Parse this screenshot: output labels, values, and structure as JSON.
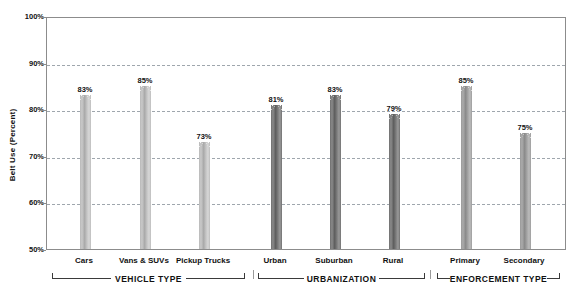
{
  "chart_data": {
    "type": "bar",
    "title": "",
    "xlabel": "",
    "ylabel": "Belt Use (Percent)",
    "ylim": [
      50,
      100
    ],
    "ytick_labels": [
      "100%",
      "90%",
      "80%",
      "70%",
      "60%",
      "50%"
    ],
    "ytick_values": [
      100,
      90,
      80,
      70,
      60,
      50
    ],
    "grid": true,
    "gridlines_at": [
      90,
      80,
      70,
      60
    ],
    "legend": "none",
    "categories": [
      "Cars",
      "Vans & SUVs",
      "Pickup Trucks",
      "Urban",
      "Suburban",
      "Rural",
      "Primary",
      "Secondary"
    ],
    "values": [
      83,
      85,
      73,
      81,
      83,
      79,
      85,
      75
    ],
    "value_labels": [
      "83%",
      "85%",
      "73%",
      "81%",
      "83%",
      "79%",
      "85%",
      "75%"
    ],
    "groups": [
      {
        "name": "VEHICLE TYPE",
        "categories": [
          "Cars",
          "Vans & SUVs",
          "Pickup Trucks"
        ],
        "values": [
          83,
          85,
          73
        ],
        "color": "#bdbdbd"
      },
      {
        "name": "URBANIZATION",
        "categories": [
          "Urban",
          "Suburban",
          "Rural"
        ],
        "values": [
          81,
          83,
          79
        ],
        "color": "#717171"
      },
      {
        "name": "ENFORCEMENT TYPE",
        "categories": [
          "Primary",
          "Secondary"
        ],
        "values": [
          85,
          75
        ],
        "color": "#9d9d9d"
      }
    ]
  },
  "axis": {
    "y_title": "Belt Use (Percent)",
    "y_ticks": [
      {
        "label": "100%",
        "value": 100
      },
      {
        "label": "90%",
        "value": 90
      },
      {
        "label": "80%",
        "value": 80
      },
      {
        "label": "70%",
        "value": 70
      },
      {
        "label": "60%",
        "value": 60
      },
      {
        "label": "50%",
        "value": 50
      }
    ]
  },
  "bars": [
    {
      "label": "Cars",
      "value": 83,
      "value_label": "83%",
      "group": 0
    },
    {
      "label": "Vans & SUVs",
      "value": 85,
      "value_label": "85%",
      "group": 0
    },
    {
      "label": "Pickup Trucks",
      "value": 73,
      "value_label": "73%",
      "group": 0
    },
    {
      "label": "Urban",
      "value": 81,
      "value_label": "81%",
      "group": 1
    },
    {
      "label": "Suburban",
      "value": 83,
      "value_label": "83%",
      "group": 1
    },
    {
      "label": "Rural",
      "value": 79,
      "value_label": "79%",
      "group": 1
    },
    {
      "label": "Primary",
      "value": 85,
      "value_label": "85%",
      "group": 2
    },
    {
      "label": "Secondary",
      "value": 75,
      "value_label": "75%",
      "group": 2
    }
  ],
  "group_brackets": [
    {
      "label": "VEHICLE TYPE"
    },
    {
      "label": "URBANIZATION"
    },
    {
      "label": "ENFORCEMENT TYPE"
    }
  ],
  "colors": {
    "group1_bar": "#bdbdbd",
    "group2_bar": "#717171",
    "group3_bar": "#9d9d9d",
    "gridline": "#9fa6ad",
    "axis": "#8c8c8c",
    "text": "#111111"
  }
}
